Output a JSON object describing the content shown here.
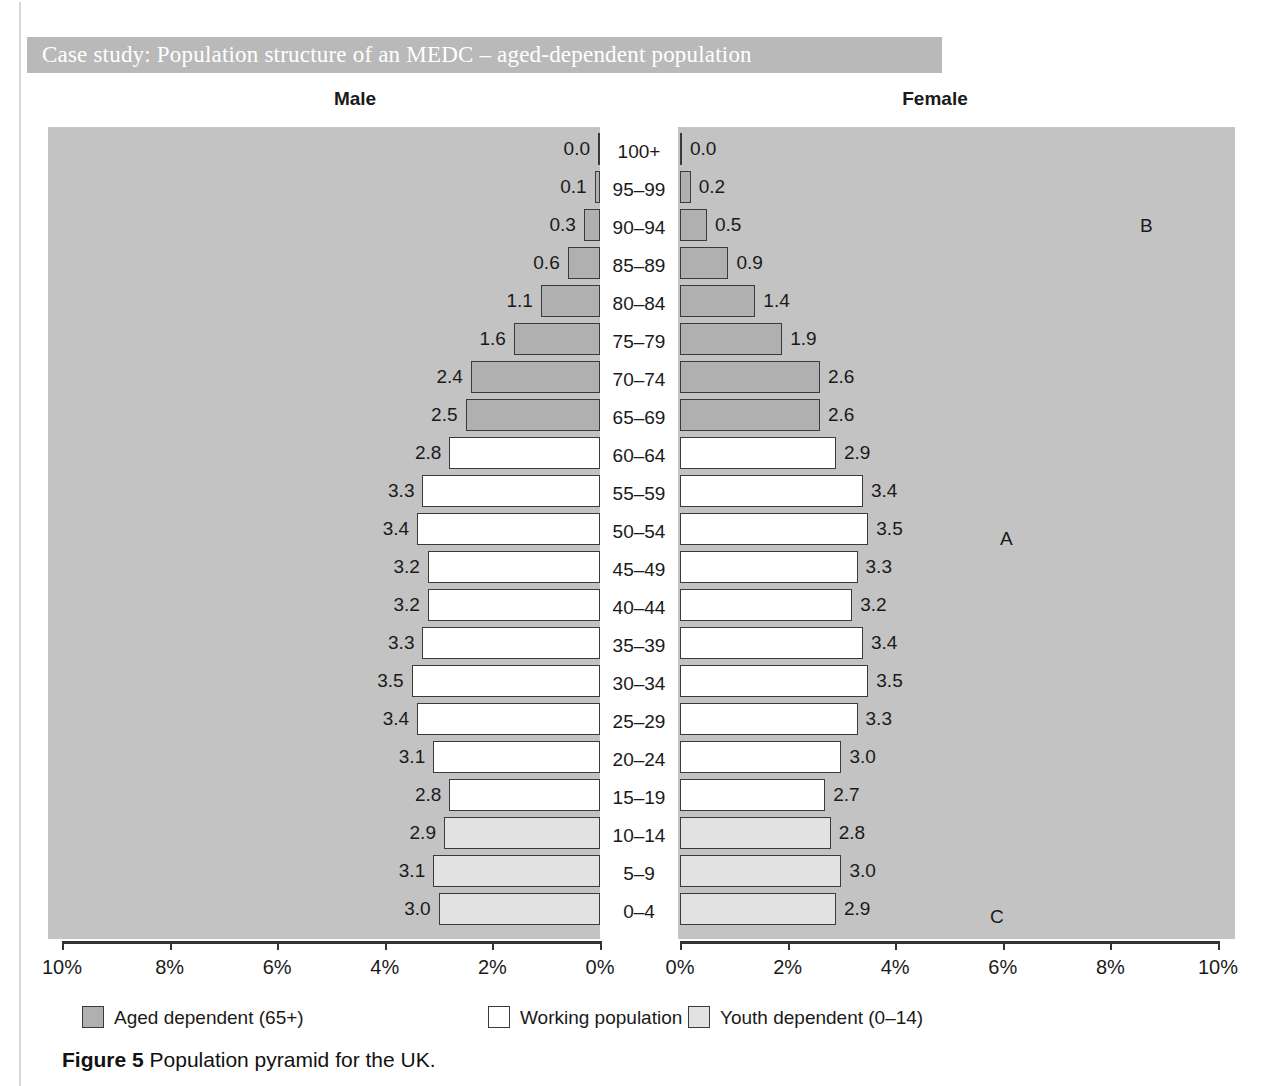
{
  "case_study": {
    "title": "Case study: Population structure of an MEDC – aged-dependent population"
  },
  "headers": {
    "male": "Male",
    "female": "Female"
  },
  "legend": [
    {
      "label": "Aged dependent (65+)",
      "swatch": "aged",
      "color": "#b0b0b0"
    },
    {
      "label": "Working population",
      "swatch": "working",
      "color": "#ffffff"
    },
    {
      "label": "Youth dependent (0–14)",
      "swatch": "youth",
      "color": "#e2e2e2"
    }
  ],
  "caption": {
    "figure": "Figure 5",
    "text": "Population pyramid for the UK."
  },
  "regions": [
    {
      "letter": "B",
      "x": 1140,
      "y": 215
    },
    {
      "letter": "A",
      "x": 1000,
      "y": 528
    },
    {
      "letter": "C",
      "x": 990,
      "y": 906
    }
  ],
  "chart_data": {
    "type": "bar",
    "title": "Population pyramid for the UK",
    "subtype": "population-pyramid",
    "xlabel": "",
    "ylabel": "",
    "xlim": [
      0,
      10
    ],
    "xunit": "%",
    "axis_ticks": [
      "10%",
      "8%",
      "6%",
      "4%",
      "2%",
      "0%"
    ],
    "axis_ticks_female": [
      "0%",
      "2%",
      "4%",
      "6%",
      "8%",
      "10%"
    ],
    "grid": false,
    "legend_position": "bottom",
    "categories": [
      "100+",
      "95–99",
      "90–94",
      "85–89",
      "80–84",
      "75–79",
      "70–74",
      "65–69",
      "60–64",
      "55–59",
      "50–54",
      "45–49",
      "40–44",
      "35–39",
      "30–34",
      "25–29",
      "20–24",
      "15–19",
      "10–14",
      "5–9",
      "0–4"
    ],
    "series": [
      {
        "name": "Male",
        "values": [
          0.0,
          0.1,
          0.3,
          0.6,
          1.1,
          1.6,
          2.4,
          2.5,
          2.8,
          3.3,
          3.4,
          3.2,
          3.2,
          3.3,
          3.5,
          3.4,
          3.1,
          2.8,
          2.9,
          3.1,
          3.0
        ],
        "labels": [
          "0.0",
          "0.1",
          "0.3",
          "0.6",
          "1.1",
          "1.6",
          "2.4",
          "2.5",
          "2.8",
          "3.3",
          "3.4",
          "3.2",
          "3.2",
          "3.3",
          "3.5",
          "3.4",
          "3.1",
          "2.8",
          "2.9",
          "3.1",
          "3.0"
        ]
      },
      {
        "name": "Female",
        "values": [
          0.0,
          0.2,
          0.5,
          0.9,
          1.4,
          1.9,
          2.6,
          2.6,
          2.9,
          3.4,
          3.5,
          3.3,
          3.2,
          3.4,
          3.5,
          3.3,
          3.0,
          2.7,
          2.8,
          3.0,
          2.9
        ],
        "labels": [
          "0.0",
          "0.2",
          "0.5",
          "0.9",
          "1.4",
          "1.9",
          "2.6",
          "2.6",
          "2.9",
          "3.4",
          "3.5",
          "3.3",
          "3.2",
          "3.4",
          "3.5",
          "3.3",
          "3.0",
          "2.7",
          "2.8",
          "3.0",
          "2.9"
        ]
      }
    ],
    "group_by_category": [
      "aged",
      "aged",
      "aged",
      "aged",
      "aged",
      "aged",
      "aged",
      "aged",
      "working",
      "working",
      "working",
      "working",
      "working",
      "working",
      "working",
      "working",
      "working",
      "working",
      "youth",
      "youth",
      "youth"
    ]
  }
}
